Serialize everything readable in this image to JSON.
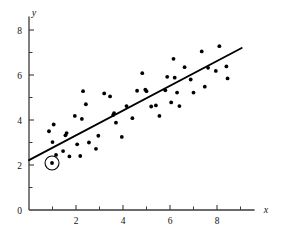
{
  "chart_data": {
    "type": "scatter",
    "title": "",
    "subtitle": "",
    "xlabel": "x",
    "ylabel": "y",
    "xlim": [
      0,
      9.6
    ],
    "ylim": [
      0,
      8.6
    ],
    "xticks_major": [
      2,
      4,
      6,
      8
    ],
    "xticks_minor": [
      1,
      3,
      5,
      7,
      9
    ],
    "xtick_labels": [
      "2",
      "4",
      "6",
      "8"
    ],
    "yticks_major": [
      0,
      2,
      4,
      6,
      8
    ],
    "yticks_minor": [
      1,
      3,
      5,
      7
    ],
    "ytick_labels": [
      "0",
      "2",
      "4",
      "6",
      "8"
    ],
    "grid": false,
    "legend": null,
    "legend_position": "none",
    "point_color": "#000000",
    "line_color": "#000000",
    "axis_color": "#3a3a3a",
    "background_color": "#ffffff",
    "series": [
      {
        "name": "observations",
        "marker": "filled-circle",
        "points": [
          [
            0.85,
            3.5
          ],
          [
            0.98,
            2.09
          ],
          [
            1.0,
            3.02
          ],
          [
            1.05,
            3.8
          ],
          [
            1.15,
            2.45
          ],
          [
            1.45,
            2.62
          ],
          [
            1.55,
            3.32
          ],
          [
            1.6,
            3.42
          ],
          [
            1.72,
            2.38
          ],
          [
            1.95,
            4.18
          ],
          [
            2.05,
            2.92
          ],
          [
            2.18,
            2.4
          ],
          [
            2.25,
            4.05
          ],
          [
            2.3,
            5.28
          ],
          [
            2.42,
            4.7
          ],
          [
            2.55,
            3.0
          ],
          [
            2.85,
            2.72
          ],
          [
            2.95,
            3.3
          ],
          [
            3.2,
            5.18
          ],
          [
            3.45,
            5.05
          ],
          [
            3.58,
            4.22
          ],
          [
            3.62,
            4.3
          ],
          [
            3.7,
            3.88
          ],
          [
            3.95,
            3.25
          ],
          [
            4.15,
            4.62
          ],
          [
            4.4,
            4.08
          ],
          [
            4.6,
            5.3
          ],
          [
            4.82,
            6.08
          ],
          [
            4.95,
            5.35
          ],
          [
            5.0,
            5.28
          ],
          [
            5.2,
            4.6
          ],
          [
            5.4,
            4.65
          ],
          [
            5.55,
            4.18
          ],
          [
            5.8,
            5.32
          ],
          [
            5.88,
            5.92
          ],
          [
            6.05,
            4.78
          ],
          [
            6.15,
            6.72
          ],
          [
            6.2,
            5.88
          ],
          [
            6.3,
            5.22
          ],
          [
            6.4,
            4.62
          ],
          [
            6.62,
            6.35
          ],
          [
            6.88,
            5.8
          ],
          [
            7.0,
            5.22
          ],
          [
            7.35,
            7.05
          ],
          [
            7.48,
            5.48
          ],
          [
            7.62,
            6.32
          ],
          [
            7.95,
            6.18
          ],
          [
            8.1,
            7.28
          ],
          [
            8.4,
            6.38
          ],
          [
            8.45,
            5.85
          ]
        ]
      }
    ],
    "regression_line": {
      "name": "least-squares fit",
      "x_start": 0.0,
      "y_start": 2.22,
      "x_end": 9.05,
      "y_end": 7.2,
      "slope": 0.55,
      "intercept": 2.22
    },
    "annotations": [
      {
        "type": "circled-point",
        "name": "highlighted-point",
        "x": 0.98,
        "y": 2.09,
        "radius_px": 7
      }
    ]
  }
}
